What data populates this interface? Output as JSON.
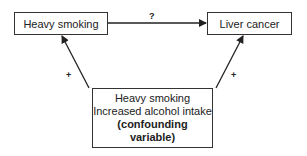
{
  "diagram": {
    "nodes": {
      "exposure": "Heavy smoking",
      "outcome": "Liver cancer",
      "confounder": {
        "line1": "Heavy smoking",
        "line2": "Increased alcohol intake",
        "line3": "(confounding",
        "line4": "variable)"
      }
    },
    "edges": {
      "exposure_to_outcome": "?",
      "confounder_to_exposure": "+",
      "confounder_to_outcome": "+"
    },
    "colors": {
      "line": "#333333",
      "background": "#ffffff"
    }
  }
}
